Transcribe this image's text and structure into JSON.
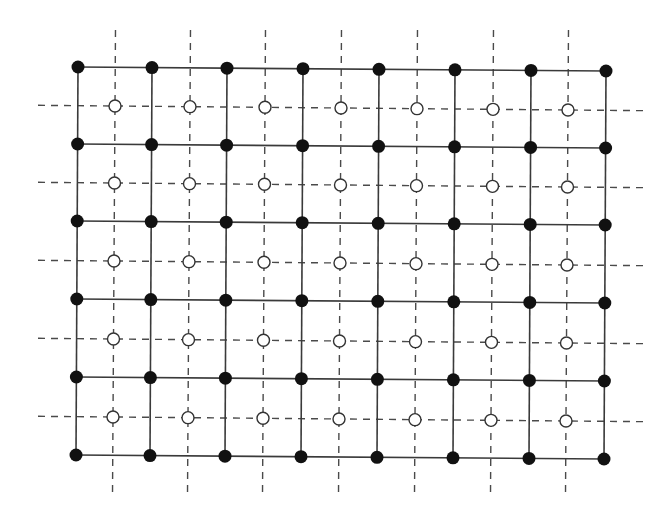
{
  "diagram": {
    "colors": {
      "background": "#ffffff",
      "solid_line": "#3a3a3a",
      "dashed_line": "#4a4a4a",
      "filled_node": "#111111",
      "open_node_fill": "#ffffff",
      "open_node_stroke": "#333333"
    },
    "primal_lattice": {
      "node_style": "filled",
      "columns": 8,
      "rows": 6,
      "x": [
        78,
        152,
        227,
        303,
        379,
        455,
        531,
        606
      ],
      "y": [
        67,
        144,
        221,
        299,
        377,
        455
      ],
      "row_tilt": 4,
      "node_radius": 6.5,
      "edge_style": "solid"
    },
    "dual_lattice": {
      "node_style": "open",
      "columns": 7,
      "rows": 5,
      "x": [
        115,
        190,
        265,
        341,
        417,
        493,
        568
      ],
      "y": [
        106,
        183,
        261,
        339,
        417
      ],
      "row_tilt": 4,
      "node_radius": 6,
      "edge_style": "dashed",
      "h_extent": [
        38,
        645
      ],
      "v_extent": [
        30,
        496
      ],
      "dash": "7 6"
    }
  }
}
